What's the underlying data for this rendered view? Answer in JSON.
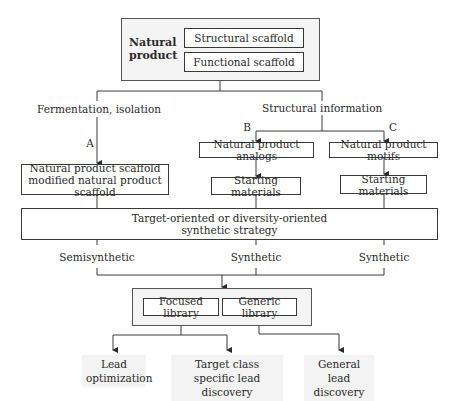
{
  "top": {
    "title": "Natural product",
    "title_line1": "Natural",
    "title_line2": "product",
    "inner": [
      "Structural scaffold",
      "Functional scaffold"
    ]
  },
  "branches": {
    "left_label": "Fermentation, isolation",
    "right_label": "Structural information",
    "path_a": "A",
    "path_b": "B",
    "path_c": "C"
  },
  "boxes": {
    "scaffold_line1": "Natural product scaffold",
    "scaffold_line2": "modified natural product scaffold",
    "analogs": "Natural product analogs",
    "motifs": "Natural product motifs",
    "starting_b": "Starting materials",
    "starting_c": "Starting materials"
  },
  "strategy": {
    "line1": "Target-oriented or diversity-oriented",
    "line2": "synthetic strategy"
  },
  "synthesis": [
    "Semisynthetic",
    "Synthetic",
    "Synthetic"
  ],
  "library": {
    "focused": "Focused library",
    "generic": "Generic library"
  },
  "outcomes": [
    {
      "line1": "Lead",
      "line2": "optimization"
    },
    {
      "line1": "Target class",
      "line2": "specific lead discovery"
    },
    {
      "line1": "General lead",
      "line2": "discovery"
    }
  ]
}
